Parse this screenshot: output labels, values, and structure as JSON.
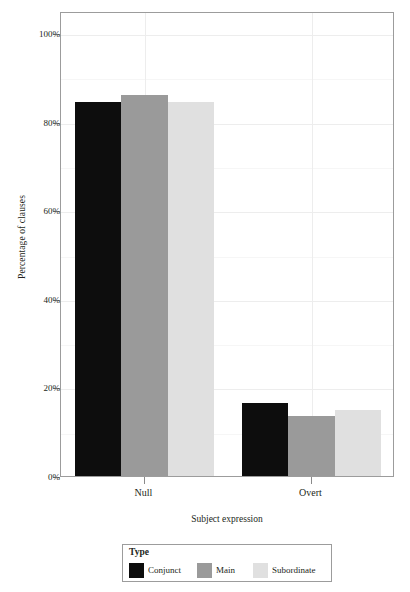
{
  "chart_data": {
    "type": "bar",
    "title": "",
    "xlabel": "Subject expression",
    "ylabel": "Percentage of clauses",
    "categories": [
      "Null",
      "Overt"
    ],
    "series": [
      {
        "name": "Conjunct",
        "color": "#0d0d0d",
        "values": [
          84.5,
          16.5
        ]
      },
      {
        "name": "Main",
        "color": "#9a9a9a",
        "values": [
          86.0,
          13.5
        ]
      },
      {
        "name": "Subordinate",
        "color": "#e0e0e0",
        "values": [
          84.5,
          15.0
        ]
      }
    ],
    "ylim": [
      0,
      105
    ],
    "yticks": [
      0,
      20,
      40,
      60,
      80,
      100
    ],
    "ytick_labels": [
      "0%",
      "20%",
      "40%",
      "60%",
      "80%",
      "100%"
    ],
    "minor_yticks": [
      10,
      30,
      50,
      70,
      90
    ],
    "grid": true,
    "legend_position": "bottom",
    "legend_title": "Type"
  },
  "axes": {
    "y_title": "Percentage of clauses",
    "x_title": "Subject expression",
    "y_labels": [
      "100%",
      "80%",
      "60%",
      "40%",
      "20%",
      "0%"
    ],
    "x_labels": [
      "Null",
      "Overt"
    ]
  },
  "legend": {
    "title": "Type",
    "entries": [
      {
        "label": "Conjunct",
        "color": "#0d0d0d"
      },
      {
        "label": "Main",
        "color": "#9a9a9a"
      },
      {
        "label": "Subordinate",
        "color": "#e0e0e0"
      }
    ]
  },
  "colors": {
    "panel_border": "#9c9c9c",
    "gridline": "#ededed",
    "gridline_minor": "#f6f6f6",
    "text": "#231f20",
    "background": "#ffffff"
  }
}
